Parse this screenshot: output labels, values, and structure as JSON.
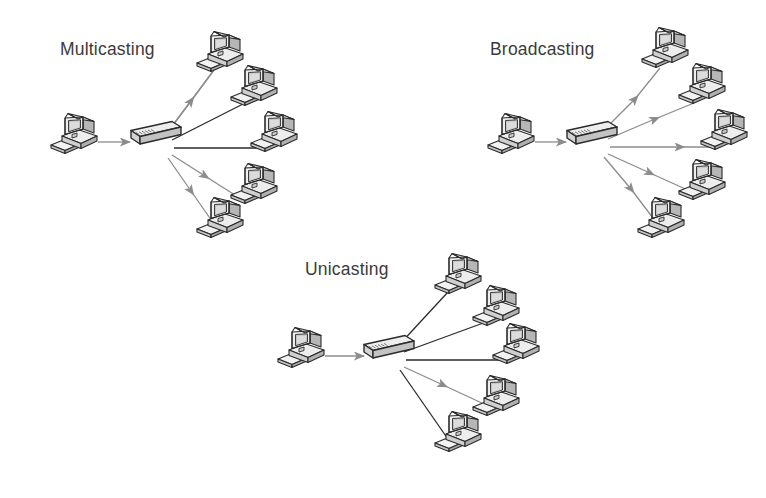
{
  "document": {
    "title": "Casting types in computer networking",
    "background_color": "#ffffff",
    "width": 766,
    "height": 498
  },
  "palette": {
    "title_text": "#3b3b3b",
    "link_gray": "#8c8c8c",
    "link_dark": "#2b2b2b",
    "device_outline": "#2b2b2b",
    "device_face_light": "#f2f2f2",
    "device_face_mid": "#d8d8d8",
    "device_face_dark": "#b4b4b4",
    "screen_fill": "#c9c9c9",
    "screen_inner": "#dedede",
    "switch_face_light": "#ededed",
    "switch_face_dark": "#bdbdbd"
  },
  "icons": {
    "computer": "desktop-computer-icon",
    "switch": "network-switch-icon",
    "arrow": "arrowhead-icon"
  },
  "diagrams": [
    {
      "id": "multicasting",
      "title": "Multicasting",
      "title_position": {
        "x": 60,
        "y": 55
      },
      "source": {
        "name": "source-computer",
        "x": 50,
        "y": 112
      },
      "switch": {
        "name": "network-switch",
        "x": 130,
        "y": 122
      },
      "feed_link": {
        "style": "gray-arrow",
        "from_x": 96,
        "to_x": 128,
        "y": 142
      },
      "destinations": [
        {
          "index": 1,
          "name": "destination-computer-1",
          "x": 196,
          "y": 30,
          "link_style": "gray-arrow"
        },
        {
          "index": 2,
          "name": "destination-computer-2",
          "x": 228,
          "y": 66,
          "link_style": "dark-plain"
        },
        {
          "index": 3,
          "name": "destination-computer-3",
          "x": 248,
          "y": 110,
          "link_style": "dark-plain"
        },
        {
          "index": 4,
          "name": "destination-computer-4",
          "x": 228,
          "y": 162,
          "link_style": "gray-arrow"
        },
        {
          "index": 5,
          "name": "destination-computer-5",
          "x": 196,
          "y": 200,
          "link_style": "gray-arrow"
        }
      ],
      "link_summary": "one source feeds the switch; the switch forwards to a selected subset of hosts"
    },
    {
      "id": "broadcasting",
      "title": "Broadcasting",
      "title_position": {
        "x": 490,
        "y": 55
      },
      "source": {
        "name": "source-computer",
        "x": 487,
        "y": 112
      },
      "switch": {
        "name": "network-switch",
        "x": 565,
        "y": 122
      },
      "feed_link": {
        "style": "gray-arrow",
        "from_x": 533,
        "to_x": 563,
        "y": 142
      },
      "destinations": [
        {
          "index": 1,
          "name": "destination-computer-1",
          "x": 641,
          "y": 28,
          "link_style": "gray-arrow"
        },
        {
          "index": 2,
          "name": "destination-computer-2",
          "x": 676,
          "y": 66,
          "link_style": "gray-arrow"
        },
        {
          "index": 3,
          "name": "destination-computer-3",
          "x": 698,
          "y": 110,
          "link_style": "gray-arrow"
        },
        {
          "index": 4,
          "name": "destination-computer-4",
          "x": 676,
          "y": 160,
          "link_style": "gray-arrow"
        },
        {
          "index": 5,
          "name": "destination-computer-5",
          "x": 637,
          "y": 200,
          "link_style": "gray-arrow"
        }
      ],
      "link_summary": "one source feeds the switch; the switch forwards to every host"
    },
    {
      "id": "unicasting",
      "title": "Unicasting",
      "title_position": {
        "x": 305,
        "y": 275
      },
      "source": {
        "name": "source-computer",
        "x": 277,
        "y": 330
      },
      "switch": {
        "name": "network-switch",
        "x": 363,
        "y": 335
      },
      "feed_link": {
        "style": "gray-arrow",
        "from_x": 323,
        "to_x": 361,
        "y": 356
      },
      "destinations": [
        {
          "index": 1,
          "name": "destination-computer-1",
          "x": 434,
          "y": 256,
          "link_style": "dark-plain"
        },
        {
          "index": 2,
          "name": "destination-computer-2",
          "x": 470,
          "y": 285,
          "link_style": "dark-plain"
        },
        {
          "index": 3,
          "name": "destination-computer-3",
          "x": 490,
          "y": 325,
          "link_style": "dark-plain"
        },
        {
          "index": 4,
          "name": "destination-computer-4",
          "x": 470,
          "y": 380,
          "link_style": "gray-arrow"
        },
        {
          "index": 5,
          "name": "destination-computer-5",
          "x": 434,
          "y": 415,
          "link_style": "dark-plain"
        }
      ],
      "link_summary": "one source feeds the switch; the switch forwards to a single host"
    }
  ]
}
